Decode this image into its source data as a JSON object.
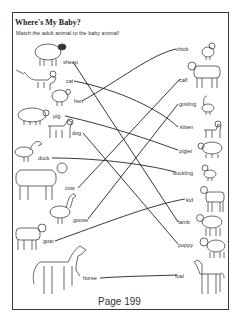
{
  "worksheet": {
    "title": "Where's My Baby?",
    "instructions": "Match the adult animal to the baby animal!",
    "page_label": "Page 199"
  },
  "adults": [
    {
      "label": "sheep",
      "x": 63,
      "y": 59
    },
    {
      "label": "cat",
      "x": 66,
      "y": 78
    },
    {
      "label": "hen",
      "x": 74,
      "y": 98
    },
    {
      "label": "pig",
      "x": 53,
      "y": 113
    },
    {
      "label": "dog",
      "x": 72,
      "y": 130
    },
    {
      "label": "duck",
      "x": 38,
      "y": 155
    },
    {
      "label": "cow",
      "x": 65,
      "y": 185
    },
    {
      "label": "goose",
      "x": 73,
      "y": 217
    },
    {
      "label": "goat",
      "x": 43,
      "y": 238
    },
    {
      "label": "horse",
      "x": 83,
      "y": 275
    }
  ],
  "babies": [
    {
      "label": "chick",
      "x": 176,
      "y": 46
    },
    {
      "label": "calf",
      "x": 179,
      "y": 77
    },
    {
      "label": "gosling",
      "x": 179,
      "y": 101
    },
    {
      "label": "kitten",
      "x": 180,
      "y": 124
    },
    {
      "label": "piglet",
      "x": 179,
      "y": 148
    },
    {
      "label": "duckling",
      "x": 173,
      "y": 170
    },
    {
      "label": "kid",
      "x": 186,
      "y": 197
    },
    {
      "label": "lamb",
      "x": 178,
      "y": 219
    },
    {
      "label": "puppy",
      "x": 178,
      "y": 242
    },
    {
      "label": "foal",
      "x": 175,
      "y": 273
    }
  ],
  "matches": [
    {
      "adult": "sheep",
      "baby": "lamb"
    },
    {
      "adult": "cat",
      "baby": "kitten"
    },
    {
      "adult": "hen",
      "baby": "chick"
    },
    {
      "adult": "pig",
      "baby": "piglet"
    },
    {
      "adult": "dog",
      "baby": "puppy"
    },
    {
      "adult": "duck",
      "baby": "duckling"
    },
    {
      "adult": "cow",
      "baby": "calf"
    },
    {
      "adult": "goose",
      "baby": "gosling"
    },
    {
      "adult": "goat",
      "baby": "kid"
    },
    {
      "adult": "horse",
      "baby": "foal"
    }
  ]
}
